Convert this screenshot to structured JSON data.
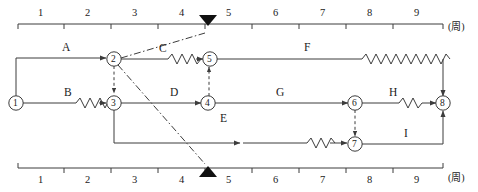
{
  "diagram": {
    "colors": {
      "line": "#3c3c3c",
      "text": "#1a1a1a",
      "marker": "#111111",
      "background": "#ffffff"
    },
    "axis_top": {
      "name": "top-time-axis",
      "unit_label": "(周)",
      "ticks": [
        "1",
        "2",
        "3",
        "4",
        "5",
        "6",
        "7",
        "8",
        "9"
      ],
      "marker": {
        "name": "top-triangle-marker",
        "glyph": "▼",
        "at_value": "4.4"
      }
    },
    "axis_bottom": {
      "name": "bottom-time-axis",
      "unit_label": "(周)",
      "ticks": [
        "1",
        "2",
        "3",
        "4",
        "5",
        "6",
        "7",
        "8",
        "9"
      ],
      "marker": {
        "name": "bottom-triangle-marker",
        "glyph": "▲",
        "at_value": "4.4"
      }
    },
    "nodes": [
      {
        "id": "1",
        "label": "1",
        "x": 16,
        "y": 103
      },
      {
        "id": "2",
        "label": "2",
        "x": 114,
        "y": 59
      },
      {
        "id": "3",
        "label": "3",
        "x": 114,
        "y": 103
      },
      {
        "id": "4",
        "label": "4",
        "x": 208,
        "y": 103
      },
      {
        "id": "5",
        "label": "5",
        "x": 210,
        "y": 59
      },
      {
        "id": "6",
        "label": "6",
        "x": 355,
        "y": 103
      },
      {
        "id": "7",
        "label": "7",
        "x": 355,
        "y": 144
      },
      {
        "id": "8",
        "label": "8",
        "x": 443,
        "y": 103
      }
    ],
    "activities": [
      {
        "name": "activity-A",
        "label": "A",
        "from": "1",
        "to": "2",
        "x": 62,
        "y": 47
      },
      {
        "name": "activity-B",
        "label": "B",
        "from": "1",
        "to": "3",
        "x": 64,
        "y": 92
      },
      {
        "name": "activity-C",
        "label": "C",
        "from": "2",
        "to": "5",
        "x": 160,
        "y": 48
      },
      {
        "name": "activity-D",
        "label": "D",
        "from": "3",
        "to": "4",
        "x": 171,
        "y": 92
      },
      {
        "name": "activity-E",
        "label": "E",
        "from": "3",
        "to": "7",
        "x": 221,
        "y": 118
      },
      {
        "name": "activity-F",
        "label": "F",
        "from": "5",
        "to": "8",
        "x": 305,
        "y": 47
      },
      {
        "name": "activity-G",
        "label": "G",
        "from": "4",
        "to": "6",
        "x": 277,
        "y": 92
      },
      {
        "name": "activity-H",
        "label": "H",
        "from": "6",
        "to": "8",
        "x": 390,
        "y": 92
      },
      {
        "name": "activity-I",
        "label": "I",
        "from": "7",
        "to": "8",
        "x": 403,
        "y": 133
      }
    ],
    "dummy_links": [
      {
        "name": "dummy-2-3",
        "from": "2",
        "to": "3"
      },
      {
        "name": "dummy-4-5",
        "from": "4",
        "to": "5"
      },
      {
        "name": "dummy-6-7",
        "from": "6",
        "to": "7"
      }
    ],
    "dashdot_lines": [
      {
        "name": "dashdot-node2-to-top-marker",
        "from": "2",
        "to": "top-triangle-marker"
      },
      {
        "name": "dashdot-node2-to-bottom-marker",
        "from": "2",
        "to": "bottom-triangle-marker"
      }
    ]
  }
}
